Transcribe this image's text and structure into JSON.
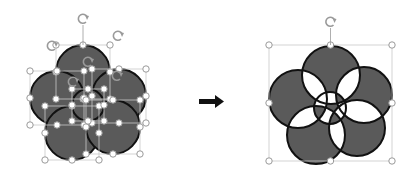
{
  "figure": {
    "fill_color": "#5a5a5a",
    "stroke_color": "#111111",
    "handle_color": "#9a9a9a",
    "arrow_color": "#111111"
  },
  "left_group": {
    "state": "separate shapes selected",
    "circles": [
      {
        "cx": 83,
        "cy": 72,
        "r": 27
      },
      {
        "cx": 119,
        "cy": 96,
        "r": 27
      },
      {
        "cx": 57,
        "cy": 98,
        "r": 27
      },
      {
        "cx": 72,
        "cy": 133,
        "r": 27
      },
      {
        "cx": 113,
        "cy": 127,
        "r": 27
      },
      {
        "cx": 88,
        "cy": 105,
        "r": 16
      }
    ]
  },
  "right_group": {
    "state": "merged shape selected",
    "circles": [
      {
        "cx": 331,
        "cy": 75,
        "r": 29
      },
      {
        "cx": 364,
        "cy": 95,
        "r": 28
      },
      {
        "cx": 298,
        "cy": 99,
        "r": 29
      },
      {
        "cx": 316,
        "cy": 135,
        "r": 29
      },
      {
        "cx": 357,
        "cy": 128,
        "r": 28
      },
      {
        "cx": 330,
        "cy": 108,
        "r": 16
      }
    ],
    "bbox": {
      "x": 269,
      "y": 45,
      "w": 123,
      "h": 116
    }
  },
  "arrow": {
    "label": "right-arrow"
  }
}
